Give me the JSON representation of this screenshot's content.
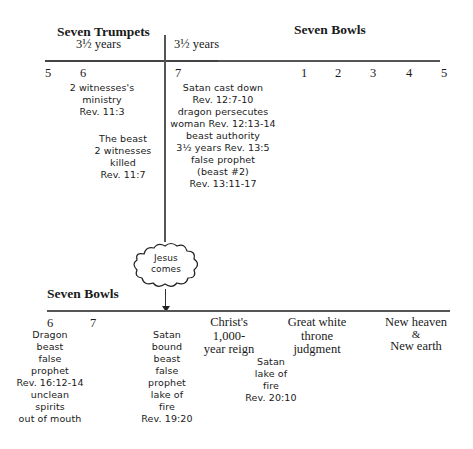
{
  "top": {
    "left_heading": "Seven Trumpets",
    "right_heading": "Seven Bowls",
    "left_years": "3½ years",
    "right_years": "3½ years",
    "trumpet_numbers": [
      "5",
      "6",
      "7"
    ],
    "bowl_numbers": [
      "1",
      "2",
      "3",
      "4",
      "5"
    ],
    "notes": {
      "witnesses_ministry": [
        "2 witnesses's",
        "ministry",
        "Rev. 11:3"
      ],
      "beast_kills": [
        "The beast",
        "2 witnesses",
        "killed",
        "Rev. 11:7"
      ],
      "satan_cast_down": [
        "Satan cast down",
        "Rev. 12:7-10",
        "dragon persecutes",
        "woman Rev. 12:13-14",
        "beast authority",
        "3½ years Rev. 13:5",
        "false prophet",
        "(beast #2)",
        "Rev. 13:11-17"
      ]
    }
  },
  "cloud": {
    "label_line1": "Jesus",
    "label_line2": "comes"
  },
  "bottom": {
    "heading": "Seven Bowls",
    "bowl_numbers": [
      "6",
      "7"
    ],
    "notes": {
      "dragon": [
        "Dragon",
        "beast",
        "false",
        "prophet",
        "Rev. 16:12-14",
        "unclean",
        "spirits",
        "out of mouth"
      ],
      "satan_bound": [
        "Satan",
        "bound",
        "beast",
        "false",
        "prophet",
        "lake of",
        "fire",
        "Rev. 19:20"
      ],
      "satan_lake": [
        "Satan",
        "lake of",
        "fire",
        "Rev. 20:10"
      ]
    },
    "events": {
      "reign": [
        "Christ's",
        "1,000-",
        "year reign"
      ],
      "judgment": [
        "Great white",
        "throne",
        "judgment"
      ],
      "new_heaven": [
        "New heaven",
        "&",
        "New earth"
      ]
    }
  }
}
